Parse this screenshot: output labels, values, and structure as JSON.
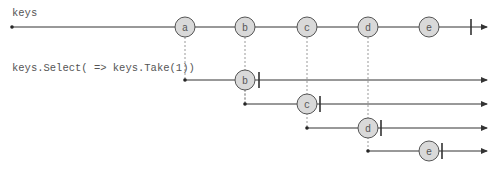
{
  "source": {
    "label": "keys",
    "y": 27,
    "start_x": 12,
    "end_x": 487,
    "complete_x": 471,
    "marbles": [
      {
        "label": "a",
        "x": 185
      },
      {
        "label": "b",
        "x": 245
      },
      {
        "label": "c",
        "x": 307
      },
      {
        "label": "d",
        "x": 368
      },
      {
        "label": "e",
        "x": 429
      }
    ]
  },
  "result": {
    "label": "keys.Select( => keys.Take(1))",
    "inner_streams": [
      {
        "start_x": 185,
        "y": 80,
        "marble": "b",
        "marble_x": 245,
        "complete_x": 259
      },
      {
        "start_x": 245,
        "y": 104,
        "marble": "c",
        "marble_x": 307,
        "complete_x": 320
      },
      {
        "start_x": 307,
        "y": 128,
        "marble": "d",
        "marble_x": 368,
        "complete_x": 381
      },
      {
        "start_x": 368,
        "y": 151,
        "marble": "e",
        "marble_x": 429,
        "complete_x": 442
      }
    ],
    "end_x": 487
  },
  "colors": {
    "marble_fill": "#d9d9d9",
    "marble_stroke": "#555555",
    "line": "#333333",
    "dashed": "#999999",
    "text": "#555555"
  }
}
